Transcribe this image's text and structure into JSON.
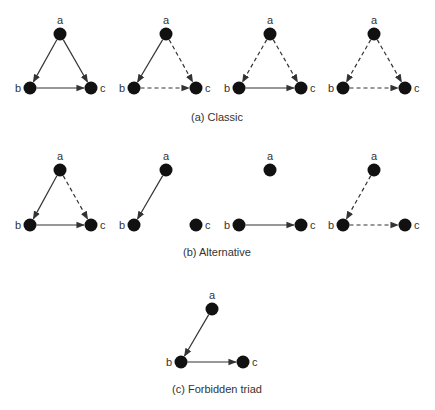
{
  "colors": {
    "node": "#111111",
    "edge": "#333333",
    "text": "#333333",
    "background": "#ffffff"
  },
  "captions": {
    "classic": "(a) Classic",
    "alternative": "(b) Alternative",
    "forbidden": "(c) Forbidden triad"
  },
  "rows": [
    {
      "id": "classic",
      "caption_key": "classic",
      "caption_pos": [
        217,
        118
      ],
      "panels": [
        {
          "nodes": {
            "a": [
              60,
              34
            ],
            "b": [
              30,
              88
            ],
            "c": [
              91,
              88
            ]
          },
          "edges": [
            {
              "from": "a",
              "to": "b",
              "style": "solid"
            },
            {
              "from": "a",
              "to": "c",
              "style": "solid"
            },
            {
              "from": "b",
              "to": "c",
              "style": "solid"
            }
          ]
        },
        {
          "nodes": {
            "a": [
              166,
              34
            ],
            "b": [
              134,
              88
            ],
            "c": [
              196,
              88
            ]
          },
          "edges": [
            {
              "from": "a",
              "to": "b",
              "style": "solid"
            },
            {
              "from": "a",
              "to": "c",
              "style": "dashed"
            },
            {
              "from": "b",
              "to": "c",
              "style": "dashed"
            }
          ]
        },
        {
          "nodes": {
            "a": [
              270,
              34
            ],
            "b": [
              239,
              88
            ],
            "c": [
              301,
              88
            ]
          },
          "edges": [
            {
              "from": "a",
              "to": "b",
              "style": "dashed"
            },
            {
              "from": "a",
              "to": "c",
              "style": "dashed"
            },
            {
              "from": "b",
              "to": "c",
              "style": "solid"
            }
          ]
        },
        {
          "nodes": {
            "a": [
              374,
              34
            ],
            "b": [
              343,
              88
            ],
            "c": [
              405,
              88
            ]
          },
          "edges": [
            {
              "from": "a",
              "to": "b",
              "style": "dashed"
            },
            {
              "from": "a",
              "to": "c",
              "style": "dashed"
            },
            {
              "from": "b",
              "to": "c",
              "style": "dashed"
            }
          ]
        }
      ]
    },
    {
      "id": "alternative",
      "caption_key": "alternative",
      "caption_pos": [
        217,
        253
      ],
      "panels": [
        {
          "nodes": {
            "a": [
              60,
              170
            ],
            "b": [
              30,
              225
            ],
            "c": [
              91,
              225
            ]
          },
          "edges": [
            {
              "from": "a",
              "to": "b",
              "style": "solid"
            },
            {
              "from": "a",
              "to": "c",
              "style": "dashed"
            },
            {
              "from": "b",
              "to": "c",
              "style": "solid"
            }
          ]
        },
        {
          "nodes": {
            "a": [
              166,
              170
            ],
            "b": [
              134,
              225
            ],
            "c": [
              196,
              225
            ]
          },
          "edges": [
            {
              "from": "a",
              "to": "b",
              "style": "solid"
            }
          ]
        },
        {
          "nodes": {
            "a": [
              270,
              170
            ],
            "b": [
              239,
              225
            ],
            "c": [
              301,
              225
            ]
          },
          "edges": [
            {
              "from": "b",
              "to": "c",
              "style": "solid"
            }
          ]
        },
        {
          "nodes": {
            "a": [
              374,
              170
            ],
            "b": [
              343,
              225
            ],
            "c": [
              405,
              225
            ]
          },
          "edges": [
            {
              "from": "a",
              "to": "b",
              "style": "dashed"
            },
            {
              "from": "b",
              "to": "c",
              "style": "dashed"
            }
          ]
        }
      ]
    },
    {
      "id": "forbidden",
      "caption_key": "forbidden",
      "caption_pos": [
        217,
        390
      ],
      "panels": [
        {
          "nodes": {
            "a": [
              212,
              309
            ],
            "b": [
              181,
              362
            ],
            "c": [
              243,
              362
            ]
          },
          "edges": [
            {
              "from": "a",
              "to": "b",
              "style": "solid"
            },
            {
              "from": "b",
              "to": "c",
              "style": "solid"
            }
          ]
        }
      ]
    }
  ],
  "node_labels": {
    "a": "a",
    "b": "b",
    "c": "c"
  }
}
